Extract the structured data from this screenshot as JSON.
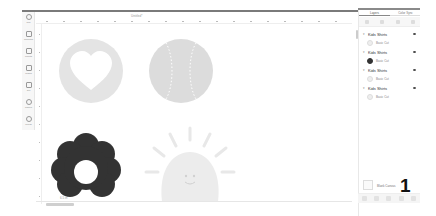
{
  "ruler": {
    "title": "Untitled*",
    "ticks": [
      "0",
      "1",
      "2",
      "3",
      "4",
      "5",
      "6",
      "7",
      "8",
      "9",
      "10",
      "11",
      "12",
      "13",
      "14",
      "15",
      "16",
      "17",
      "18",
      "19",
      "20",
      "21",
      "22",
      "23"
    ]
  },
  "left_toolbar": {
    "items": [
      {
        "label": "New",
        "icon": "plus-circle-icon"
      },
      {
        "label": "Templates",
        "icon": "tshirt-icon"
      },
      {
        "label": "Projects",
        "icon": "clipboard-icon"
      },
      {
        "label": "Images",
        "icon": "image-icon"
      },
      {
        "label": "Text",
        "icon": "text-icon"
      },
      {
        "label": "Shapes",
        "icon": "shapes-icon"
      },
      {
        "label": "Upload",
        "icon": "upload-icon"
      }
    ]
  },
  "canvas": {
    "shapes": [
      {
        "name": "heart-circle",
        "color": "#e4e4e4"
      },
      {
        "name": "baseball",
        "color": "#dcdcdc"
      },
      {
        "name": "flower",
        "color": "#333333"
      },
      {
        "name": "sun",
        "color": "#ececec"
      }
    ],
    "flower_label": "6.5 in"
  },
  "right_panel": {
    "tabs": [
      {
        "label": "Layers",
        "active": true
      },
      {
        "label": "Color Sync",
        "active": false
      }
    ],
    "tool_labels": [
      "Group",
      "Ungroup",
      "Duplicate",
      "Delete"
    ],
    "groups": [
      {
        "name": "Kids Shirts",
        "layer": "Basic Cut",
        "thumb": "light"
      },
      {
        "name": "Kids Shirts",
        "layer": "Basic Cut",
        "thumb": "dark"
      },
      {
        "name": "Kids Shirts",
        "layer": "Basic Cut",
        "thumb": "light"
      },
      {
        "name": "Kids Shirts",
        "layer": "Basic Cut",
        "thumb": "light"
      }
    ],
    "blank_canvas_label": "Blank Canvas",
    "number": "1",
    "bottom_actions": [
      "Slice",
      "Weld",
      "Attach",
      "Flatten",
      "Contour"
    ]
  }
}
